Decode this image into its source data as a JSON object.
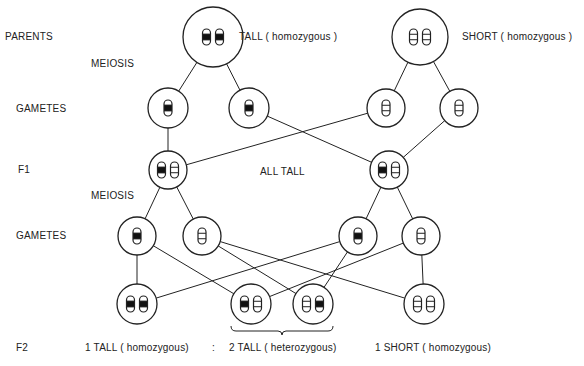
{
  "row_labels": {
    "parents": "PARENTS",
    "meiosis_1": "MEIOSIS",
    "gametes_1": "GAMETES",
    "f1": "F1",
    "meiosis_2": "MEIOSIS",
    "gametes_2": "GAMETES",
    "f2": "F2"
  },
  "annotations": {
    "tall_parent": "TALL ( homozygous )",
    "short_parent": "SHORT ( homozygous )",
    "f1_result": "ALL TALL",
    "f2_tall_homo": "1 TALL ( homozygous)",
    "f2_ratio_sep": ":",
    "f2_tall_hetero": "2 TALL ( heterozygous)",
    "f2_short_homo": "1 SHORT ( homozygous)"
  },
  "colors": {
    "line": "#222222",
    "dominant_band": "#111111",
    "background": "#ffffff"
  },
  "cells": [
    {
      "id": "parent-tall",
      "cx": 213,
      "cy": 37,
      "r": 30,
      "alleles": [
        "T",
        "T"
      ]
    },
    {
      "id": "parent-short",
      "cx": 420,
      "cy": 37,
      "r": 28,
      "alleles": [
        "t",
        "t"
      ]
    },
    {
      "id": "gamete1-tall-a",
      "cx": 168,
      "cy": 108,
      "r": 20,
      "alleles": [
        "T"
      ]
    },
    {
      "id": "gamete1-tall-b",
      "cx": 249,
      "cy": 108,
      "r": 20,
      "alleles": [
        "T"
      ]
    },
    {
      "id": "gamete1-short-a",
      "cx": 386,
      "cy": 108,
      "r": 19,
      "alleles": [
        "t"
      ]
    },
    {
      "id": "gamete1-short-b",
      "cx": 459,
      "cy": 108,
      "r": 19,
      "alleles": [
        "t"
      ]
    },
    {
      "id": "f1-left",
      "cx": 168,
      "cy": 170,
      "r": 19,
      "alleles": [
        "T",
        "t"
      ]
    },
    {
      "id": "f1-right",
      "cx": 389,
      "cy": 170,
      "r": 19,
      "alleles": [
        "T",
        "t"
      ]
    },
    {
      "id": "gamete2-a",
      "cx": 137,
      "cy": 236,
      "r": 19,
      "alleles": [
        "T"
      ]
    },
    {
      "id": "gamete2-b",
      "cx": 202,
      "cy": 236,
      "r": 19,
      "alleles": [
        "t"
      ]
    },
    {
      "id": "gamete2-c",
      "cx": 358,
      "cy": 236,
      "r": 19,
      "alleles": [
        "T"
      ]
    },
    {
      "id": "gamete2-d",
      "cx": 421,
      "cy": 236,
      "r": 19,
      "alleles": [
        "t"
      ]
    },
    {
      "id": "f2-a",
      "cx": 137,
      "cy": 304,
      "r": 20,
      "alleles": [
        "T",
        "T"
      ]
    },
    {
      "id": "f2-b",
      "cx": 251,
      "cy": 304,
      "r": 20,
      "alleles": [
        "T",
        "t"
      ]
    },
    {
      "id": "f2-c",
      "cx": 313,
      "cy": 304,
      "r": 20,
      "alleles": [
        "t",
        "T"
      ]
    },
    {
      "id": "f2-d",
      "cx": 424,
      "cy": 304,
      "r": 20,
      "alleles": [
        "t",
        "t"
      ]
    }
  ],
  "edges": [
    [
      "parent-tall",
      "gamete1-tall-a"
    ],
    [
      "parent-tall",
      "gamete1-tall-b"
    ],
    [
      "parent-short",
      "gamete1-short-a"
    ],
    [
      "parent-short",
      "gamete1-short-b"
    ],
    [
      "gamete1-tall-a",
      "f1-left"
    ],
    [
      "gamete1-short-a",
      "f1-left"
    ],
    [
      "gamete1-tall-b",
      "f1-right"
    ],
    [
      "gamete1-short-b",
      "f1-right"
    ],
    [
      "f1-left",
      "gamete2-a"
    ],
    [
      "f1-left",
      "gamete2-b"
    ],
    [
      "f1-right",
      "gamete2-c"
    ],
    [
      "f1-right",
      "gamete2-d"
    ],
    [
      "gamete2-a",
      "f2-a"
    ],
    [
      "gamete2-a",
      "f2-b"
    ],
    [
      "gamete2-b",
      "f2-c"
    ],
    [
      "gamete2-b",
      "f2-d"
    ],
    [
      "gamete2-c",
      "f2-a"
    ],
    [
      "gamete2-c",
      "f2-c"
    ],
    [
      "gamete2-d",
      "f2-b"
    ],
    [
      "gamete2-d",
      "f2-d"
    ]
  ],
  "brace": {
    "x1": 231,
    "x2": 333,
    "y": 331
  }
}
